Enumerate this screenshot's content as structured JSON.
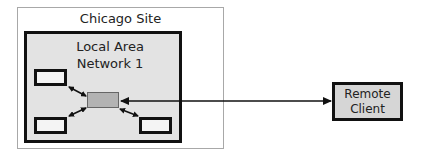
{
  "diagram": {
    "site": {
      "label": "Chicago Site"
    },
    "lan": {
      "label_line1": "Local Area",
      "label_line2": "Network 1"
    },
    "nodes": [
      {
        "id": "node-top-left"
      },
      {
        "id": "node-bottom-left"
      },
      {
        "id": "node-bottom-right"
      }
    ],
    "hub": {
      "id": "hub"
    },
    "remote": {
      "label_line1": "Remote",
      "label_line2": "Client"
    },
    "connections": [
      {
        "from": "node-top-left",
        "to": "hub",
        "type": "bidirectional"
      },
      {
        "from": "node-bottom-left",
        "to": "hub",
        "type": "bidirectional"
      },
      {
        "from": "node-bottom-right",
        "to": "hub",
        "type": "bidirectional"
      },
      {
        "from": "remote",
        "to": "hub",
        "type": "unidirectional-arrow-to-hub-and-remote"
      }
    ]
  }
}
